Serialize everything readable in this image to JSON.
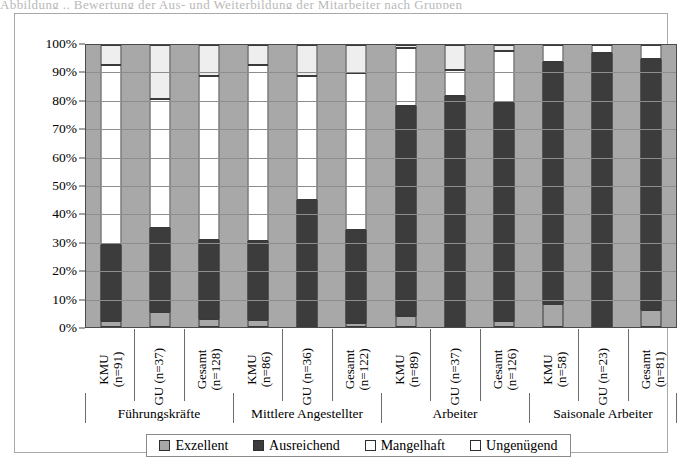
{
  "top_cut_text": "Abbildung .. Bewertung der Aus- und Weiterbildung der Mitarbeiter nach Gruppen",
  "chart_data": {
    "type": "bar",
    "subtype": "stacked-percent",
    "title": "",
    "xlabel": "",
    "ylabel": "",
    "ylim": [
      0,
      100
    ],
    "yticks": [
      "0%",
      "10%",
      "20%",
      "30%",
      "40%",
      "50%",
      "60%",
      "70%",
      "80%",
      "90%",
      "100%"
    ],
    "ytick_values": [
      0,
      10,
      20,
      30,
      40,
      50,
      60,
      70,
      80,
      90,
      100
    ],
    "grid": true,
    "legend_position": "bottom",
    "groups": [
      {
        "label": "Führungskräfte",
        "size": 3
      },
      {
        "label": "Mittlere Angestellter",
        "size": 3
      },
      {
        "label": "Arbeiter",
        "size": 3
      },
      {
        "label": "Saisonale Arbeiter",
        "size": 3
      }
    ],
    "categories": [
      {
        "line1": "KMU",
        "line2": "(n=91)"
      },
      {
        "line1": "GU (n=37)",
        "line2": ""
      },
      {
        "line1": "Gesamt",
        "line2": "(n=128)"
      },
      {
        "line1": "KMU",
        "line2": "(n=86)"
      },
      {
        "line1": "GU (n=36)",
        "line2": ""
      },
      {
        "line1": "Gesamt",
        "line2": "(n=122)"
      },
      {
        "line1": "KMU",
        "line2": "(n=89)"
      },
      {
        "line1": "GU (n=37)",
        "line2": ""
      },
      {
        "line1": "Gesamt",
        "line2": "(n=126)"
      },
      {
        "line1": "KMU",
        "line2": "(n=58)"
      },
      {
        "line1": "GU (n=23)",
        "line2": ""
      },
      {
        "line1": "Gesamt",
        "line2": "(n=81)"
      }
    ],
    "series": [
      {
        "name": "Exzellent",
        "color": "#a8a8a8",
        "values": [
          2,
          5.5,
          3,
          2.5,
          0,
          1.5,
          4,
          0,
          2,
          8,
          0,
          6
        ]
      },
      {
        "name": "Ausreichend",
        "color": "#3c3c3c",
        "values": [
          27,
          29.5,
          28,
          28,
          45,
          33,
          74.5,
          82,
          77.5,
          86,
          97,
          89
        ]
      },
      {
        "name": "Mangelhaft",
        "color": "#ffffff",
        "values": [
          64,
          46,
          58,
          62.5,
          44,
          55.5,
          20.5,
          9,
          18.5,
          6,
          3,
          5
        ]
      },
      {
        "name": "Ungenügend",
        "color": "#eeeeee",
        "values": [
          7,
          19,
          11,
          7,
          11,
          10,
          1,
          9,
          2,
          0,
          0,
          0
        ]
      }
    ]
  },
  "legend": {
    "items": [
      {
        "label": "Exzellent",
        "color": "#a8a8a8"
      },
      {
        "label": "Ausreichend",
        "color": "#3c3c3c"
      },
      {
        "label": "Mangelhaft",
        "color": "#ffffff"
      },
      {
        "label": "Ungenügend",
        "color": "#ffffff"
      }
    ]
  }
}
